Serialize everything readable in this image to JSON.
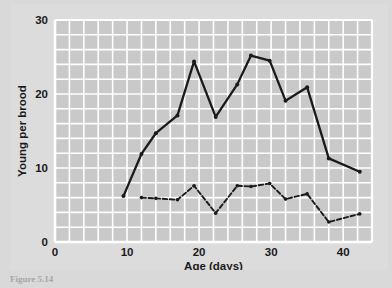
{
  "figure": {
    "caption": "Figure 5.14   ",
    "background_color": "#dcdcdc",
    "plot_background_color": "#c9c9c9",
    "gridline_color": "#ffffff",
    "line_color": "#1a1a1a"
  },
  "chart_data": {
    "type": "line",
    "title": "",
    "xlabel": "Age (days)",
    "ylabel": "Young per brood",
    "xlim": [
      0,
      44
    ],
    "ylim": [
      0,
      30
    ],
    "xticks": [
      0,
      10,
      20,
      30,
      40
    ],
    "xtick_labels": [
      "0",
      "10",
      "20",
      "30",
      "40"
    ],
    "yticks": [
      0,
      10,
      20,
      30
    ],
    "ytick_labels": [
      "0",
      "10",
      "20",
      "30"
    ],
    "x_minor_step": 2,
    "y_minor_step": 2,
    "grid": true,
    "legend": "none",
    "series": [
      {
        "name": "upper-solid",
        "style": "solid",
        "marker": "dot",
        "points": [
          [
            9.5,
            6.2
          ],
          [
            12.0,
            11.9
          ],
          [
            14.0,
            14.7
          ],
          [
            17.0,
            17.1
          ],
          [
            19.3,
            24.4
          ],
          [
            22.3,
            16.9
          ],
          [
            25.3,
            21.3
          ],
          [
            27.2,
            25.2
          ],
          [
            29.8,
            24.5
          ],
          [
            32.0,
            19.1
          ],
          [
            35.0,
            20.9
          ],
          [
            38.0,
            11.3
          ],
          [
            42.3,
            9.5
          ]
        ]
      },
      {
        "name": "lower-dashed",
        "style": "dashed",
        "marker": "dot",
        "points": [
          [
            12.0,
            6.0
          ],
          [
            14.0,
            5.9
          ],
          [
            17.0,
            5.7
          ],
          [
            19.3,
            7.6
          ],
          [
            22.3,
            3.9
          ],
          [
            25.3,
            7.6
          ],
          [
            27.2,
            7.5
          ],
          [
            29.8,
            7.9
          ],
          [
            32.0,
            5.8
          ],
          [
            35.0,
            6.5
          ],
          [
            38.0,
            2.7
          ],
          [
            42.3,
            3.8
          ]
        ]
      }
    ]
  }
}
